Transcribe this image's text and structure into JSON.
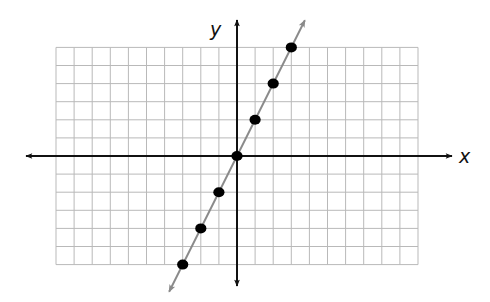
{
  "chart_data": {
    "type": "line",
    "title": "",
    "xlabel": "x",
    "ylabel": "y",
    "xlim": [
      -10,
      10
    ],
    "ylim": [
      -6,
      6
    ],
    "grid": true,
    "grid_step": 1,
    "tick_labels": false,
    "equation": "y = 2x",
    "series": [
      {
        "name": "y = 2x",
        "points": [
          [
            -3,
            -6
          ],
          [
            -2,
            -4
          ],
          [
            -1,
            -2
          ],
          [
            0,
            0
          ],
          [
            1,
            2
          ],
          [
            2,
            4
          ],
          [
            3,
            6
          ]
        ],
        "line_color": "#8a8a8a",
        "marker_color": "#000000",
        "line_arrows": true
      }
    ]
  },
  "labels": {
    "x_axis": "x",
    "y_axis": "y"
  },
  "colors": {
    "grid": "#b9b9b9",
    "axes": "#111111",
    "line": "#8a8a8a",
    "points": "#000000"
  }
}
